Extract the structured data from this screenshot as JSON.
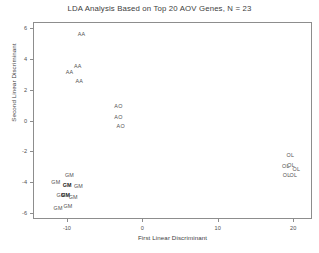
{
  "chart_data": {
    "type": "scatter",
    "title": "LDA Analysis Based on Top 20 AOV Genes, N = 23",
    "xlabel": "First Linear Discriminant",
    "ylabel": "Second Linear Discriminant",
    "xlim": [
      -14.5,
      22.5
    ],
    "ylim": [
      -6.4,
      6.4
    ],
    "xticks": [
      -10,
      0,
      10,
      20
    ],
    "xticklabels": [
      "-10",
      "0",
      "10",
      "20"
    ],
    "yticks": [
      6,
      4,
      2,
      0,
      -2,
      -4,
      -6
    ],
    "yticklabels": [
      "6",
      "4",
      "2",
      "0",
      "-2",
      "-4",
      "-6"
    ],
    "grid": false,
    "legend": "none",
    "marker_style": "text-label",
    "groups": [
      "AA",
      "AO",
      "OL",
      "GM"
    ],
    "points": [
      {
        "label": "AA",
        "x": -8.2,
        "y": 5.7
      },
      {
        "label": "AA",
        "x": -8.7,
        "y": 3.6
      },
      {
        "label": "AA",
        "x": -9.8,
        "y": 3.2
      },
      {
        "label": "AA",
        "x": -8.5,
        "y": 2.6
      },
      {
        "label": "AO",
        "x": -3.3,
        "y": 1.0
      },
      {
        "label": "AO",
        "x": -3.3,
        "y": 0.3
      },
      {
        "label": "AO",
        "x": -3.0,
        "y": -0.3
      },
      {
        "label": "OL",
        "x": 19.5,
        "y": -2.2
      },
      {
        "label": "OL",
        "x": 18.9,
        "y": -2.9
      },
      {
        "label": "OL",
        "x": 19.6,
        "y": -2.8
      },
      {
        "label": "OL",
        "x": 20.3,
        "y": -3.1
      },
      {
        "label": "OL",
        "x": 19.0,
        "y": -3.5
      },
      {
        "label": "OL",
        "x": 19.9,
        "y": -3.5
      },
      {
        "label": "GM",
        "x": -9.8,
        "y": -3.5
      },
      {
        "label": "GM",
        "x": -11.6,
        "y": -3.9
      },
      {
        "label": "GM",
        "x": -10.1,
        "y": -4.1,
        "bold": true
      },
      {
        "label": "GM",
        "x": -8.6,
        "y": -4.2
      },
      {
        "label": "GM",
        "x": -10.9,
        "y": -4.8
      },
      {
        "label": "GM",
        "x": -10.3,
        "y": -4.8,
        "bold": true
      },
      {
        "label": "GM",
        "x": -9.3,
        "y": -4.9
      },
      {
        "label": "GM",
        "x": -11.3,
        "y": -5.6
      },
      {
        "label": "GM",
        "x": -10.0,
        "y": -5.5
      }
    ]
  }
}
